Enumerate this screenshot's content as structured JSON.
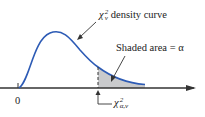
{
  "diagram": {
    "curve_label": {
      "symbol": "χ",
      "sup": "2",
      "sub": "ν",
      "text": "density curve"
    },
    "shaded_label": "Shaded area = α",
    "origin_label": "0",
    "critical_label": {
      "symbol": "χ",
      "sup": "2",
      "sub": "α,ν"
    },
    "colors": {
      "curve": "#2d5bb5",
      "shade": "#c9cacc",
      "axis": "#333333",
      "text": "#222222"
    }
  }
}
